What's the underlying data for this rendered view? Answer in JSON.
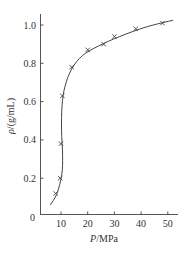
{
  "chart_data": {
    "type": "scatter",
    "title": "",
    "xlabel": "P/MPa",
    "ylabel": "ρ/(g/mL)",
    "xlabel_italic_part": "P",
    "xlabel_unit_part": "/MPa",
    "ylabel_italic_part": "ρ",
    "ylabel_unit_part": "/(g/mL)",
    "xlim": [
      0,
      55
    ],
    "ylim": [
      0,
      1.05
    ],
    "x_ticks": [
      10,
      20,
      30,
      40,
      50
    ],
    "y_ticks": [
      0,
      0.2,
      0.4,
      0.6,
      0.8,
      1.0
    ],
    "y_tick_labels": [
      "0",
      "0.2",
      "0.4",
      "0.6",
      "0.8",
      "1.0"
    ],
    "x_tick_labels": [
      "10",
      "20",
      "30",
      "40",
      "50"
    ],
    "grid": false,
    "legend": null,
    "series": [
      {
        "name": "measured",
        "marker": "x",
        "points": [
          {
            "x": 8.0,
            "y": 0.12
          },
          {
            "x": 9.7,
            "y": 0.2
          },
          {
            "x": 10.0,
            "y": 0.38
          },
          {
            "x": 10.5,
            "y": 0.63
          },
          {
            "x": 14.0,
            "y": 0.78
          },
          {
            "x": 20.0,
            "y": 0.87
          },
          {
            "x": 26.0,
            "y": 0.9
          },
          {
            "x": 30.0,
            "y": 0.94
          },
          {
            "x": 38.0,
            "y": 0.98
          },
          {
            "x": 48.0,
            "y": 1.01
          }
        ]
      },
      {
        "name": "fitted curve",
        "type": "line",
        "points": [
          {
            "x": 6.0,
            "y": 0.06
          },
          {
            "x": 8.5,
            "y": 0.12
          },
          {
            "x": 10.3,
            "y": 0.22
          },
          {
            "x": 10.6,
            "y": 0.32
          },
          {
            "x": 10.2,
            "y": 0.45
          },
          {
            "x": 10.4,
            "y": 0.58
          },
          {
            "x": 11.5,
            "y": 0.68
          },
          {
            "x": 14.0,
            "y": 0.77
          },
          {
            "x": 18.0,
            "y": 0.84
          },
          {
            "x": 24.0,
            "y": 0.89
          },
          {
            "x": 32.0,
            "y": 0.94
          },
          {
            "x": 42.0,
            "y": 0.99
          },
          {
            "x": 52.0,
            "y": 1.025
          }
        ]
      }
    ]
  }
}
